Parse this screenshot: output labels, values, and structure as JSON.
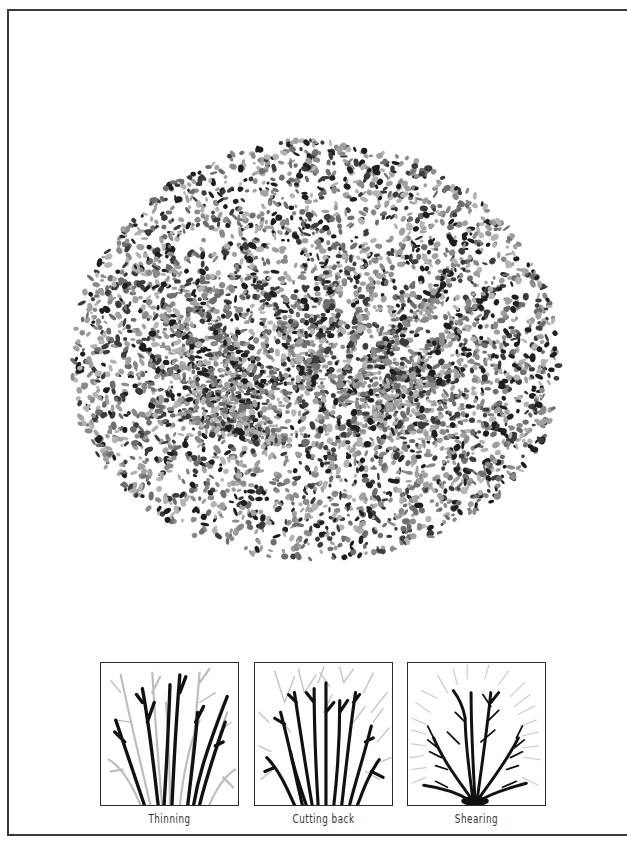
{
  "figure": {
    "colors": {
      "frame": "#3a3a3a",
      "dark_branch": "#111111",
      "light_branch": "#bdbdbd",
      "foliage_dark": "#1e1e1e",
      "foliage_mid": "#6e6e6e",
      "foliage_light": "#b4b4b4"
    }
  },
  "panels": [
    {
      "id": "thinning",
      "label": "Thinning"
    },
    {
      "id": "cutting-back",
      "label": "Cutting back"
    },
    {
      "id": "shearing",
      "label": "Shearing"
    }
  ]
}
